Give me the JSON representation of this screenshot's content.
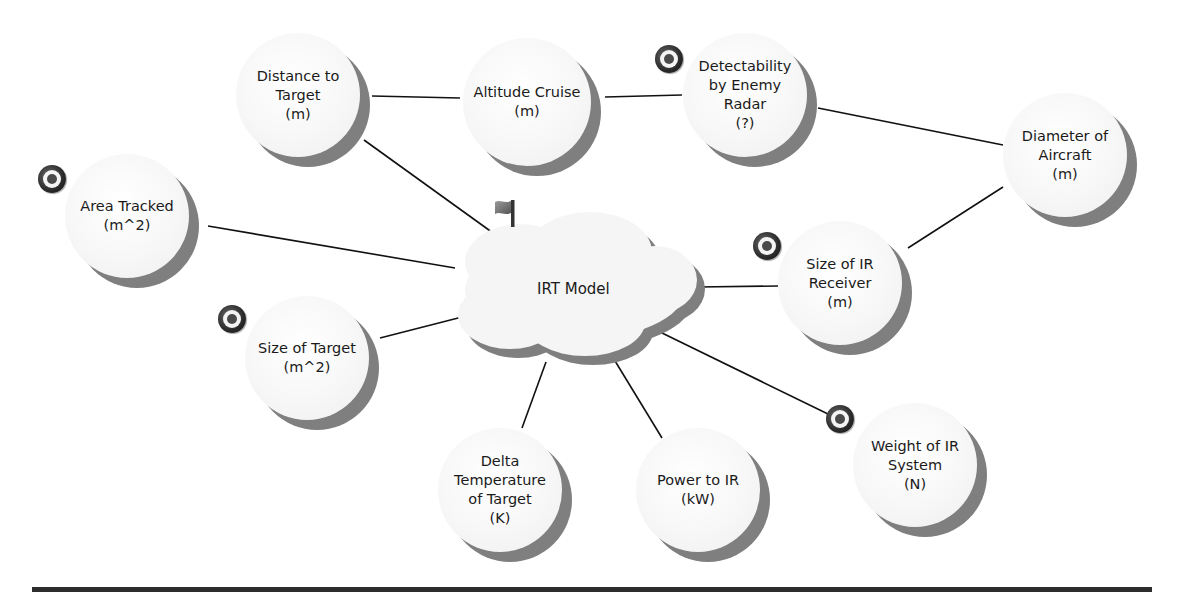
{
  "diagram": {
    "central": {
      "label": "IRT Model",
      "x": 575,
      "y": 290,
      "icon": "flag-icon"
    },
    "nodes": [
      {
        "id": "distance",
        "label": "Distance to\nTarget\n(m)",
        "cx": 298,
        "cy": 95,
        "r": 62,
        "target_icon": false
      },
      {
        "id": "altitude",
        "label": "Altitude Cruise\n(m)",
        "cx": 527,
        "cy": 102,
        "r": 64,
        "target_icon": false
      },
      {
        "id": "detect",
        "label": "Detectability\nby Enemy\nRadar\n(?)",
        "cx": 745,
        "cy": 95,
        "r": 62,
        "target_icon": true,
        "icon_x": 655,
        "icon_y": 45
      },
      {
        "id": "diameter",
        "label": "Diameter of\nAircraft\n(m)",
        "cx": 1065,
        "cy": 155,
        "r": 62,
        "target_icon": false
      },
      {
        "id": "area",
        "label": "Area Tracked\n(m^2)",
        "cx": 127,
        "cy": 216,
        "r": 62,
        "target_icon": true,
        "icon_x": 38,
        "icon_y": 165
      },
      {
        "id": "irreceiver",
        "label": "Size of IR\nReceiver\n(m)",
        "cx": 840,
        "cy": 283,
        "r": 62,
        "target_icon": true,
        "icon_x": 753,
        "icon_y": 232
      },
      {
        "id": "sizetarget",
        "label": "Size of Target\n(m^2)",
        "cx": 307,
        "cy": 358,
        "r": 62,
        "target_icon": true,
        "icon_x": 218,
        "icon_y": 305
      },
      {
        "id": "delta",
        "label": "Delta\nTemperature\nof Target\n(K)",
        "cx": 500,
        "cy": 490,
        "r": 62,
        "target_icon": false
      },
      {
        "id": "power",
        "label": "Power to IR\n(kW)",
        "cx": 698,
        "cy": 490,
        "r": 62,
        "target_icon": false
      },
      {
        "id": "weight",
        "label": "Weight of IR\nSystem\n(N)",
        "cx": 915,
        "cy": 465,
        "r": 62,
        "target_icon": true,
        "icon_x": 826,
        "icon_y": 405
      }
    ],
    "edges": [
      {
        "x1": 372,
        "y1": 96,
        "x2": 460,
        "y2": 98
      },
      {
        "x1": 605,
        "y1": 97,
        "x2": 682,
        "y2": 95
      },
      {
        "x1": 818,
        "y1": 108,
        "x2": 1003,
        "y2": 145
      },
      {
        "x1": 1003,
        "y1": 187,
        "x2": 908,
        "y2": 248
      },
      {
        "x1": 364,
        "y1": 140,
        "x2": 500,
        "y2": 238
      },
      {
        "x1": 208,
        "y1": 226,
        "x2": 455,
        "y2": 268
      },
      {
        "x1": 698,
        "y1": 287,
        "x2": 778,
        "y2": 286
      },
      {
        "x1": 380,
        "y1": 338,
        "x2": 466,
        "y2": 316
      },
      {
        "x1": 546,
        "y1": 362,
        "x2": 522,
        "y2": 428
      },
      {
        "x1": 612,
        "y1": 356,
        "x2": 662,
        "y2": 438
      },
      {
        "x1": 660,
        "y1": 332,
        "x2": 828,
        "y2": 414
      }
    ]
  },
  "colors": {
    "line": "#111111",
    "shadow": "#7f7f7f",
    "face": "#f6f6f6",
    "rule": "#2d2d2d"
  }
}
